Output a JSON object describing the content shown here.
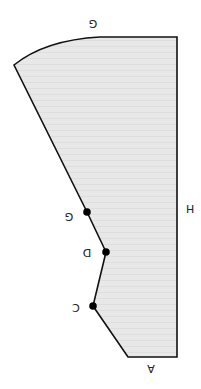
{
  "diagram": {
    "fill_color": "#e6e6e6",
    "stroke_color": "#111111",
    "labels": {
      "top": "G",
      "right": "H",
      "bottom": "A",
      "point_g": "G",
      "point_d": "D",
      "point_c": "C"
    },
    "points": [
      {
        "name": "G",
        "x": 87,
        "y": 212
      },
      {
        "name": "D",
        "x": 106,
        "y": 252
      },
      {
        "name": "C",
        "x": 93,
        "y": 306
      }
    ]
  }
}
